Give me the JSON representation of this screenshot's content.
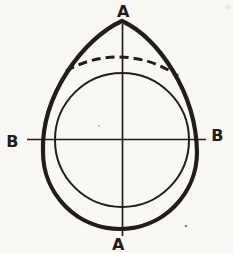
{
  "figure": {
    "labels": {
      "top": "A",
      "bottom": "A",
      "left": "B",
      "right": "B"
    },
    "colors": {
      "ink": "#211e1a",
      "paper": "#f9f8f4",
      "speck": "#6b675f",
      "smudge": "#d8d4cc"
    }
  }
}
